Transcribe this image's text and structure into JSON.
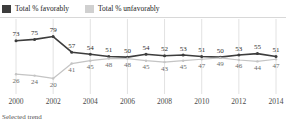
{
  "legend": {
    "items": [
      {
        "label": "Total % favorably",
        "color": "#3d3d3d",
        "icon": "square-swatch-icon"
      },
      {
        "label": "Total % unfavorably",
        "color": "#d0d0d0",
        "icon": "square-swatch-icon"
      }
    ]
  },
  "footer": {
    "note": "Selected trend"
  },
  "chart_data": {
    "type": "line",
    "title": "",
    "subtitle": "",
    "xlabel": "",
    "ylabel": "",
    "grid": "vertical-only",
    "legend_position": "top-left",
    "x": [
      2000,
      2001,
      2002,
      2003,
      2004,
      2005,
      2006,
      2007,
      2008,
      2009,
      2010,
      2011,
      2012,
      2013,
      2014
    ],
    "xtick_labels": [
      "2000",
      "2002",
      "2004",
      "2006",
      "2008",
      "2010",
      "2012",
      "2014"
    ],
    "xtick_values": [
      2000,
      2002,
      2004,
      2006,
      2008,
      2010,
      2012,
      2014
    ],
    "xlim": [
      2000,
      2014
    ],
    "ylim": [
      15,
      84
    ],
    "series": [
      {
        "name": "Total % favorably",
        "color": "#3d3d3d",
        "label_position": "above",
        "values": [
          73,
          75,
          79,
          57,
          54,
          51,
          50,
          54,
          52,
          53,
          51,
          50,
          53,
          55,
          51
        ],
        "labels": [
          "73",
          "75",
          "79",
          "57",
          "54",
          "51",
          "50",
          "54",
          "52",
          "53",
          "51",
          "50",
          "53",
          "55",
          "51"
        ]
      },
      {
        "name": "Total % unfavorably",
        "color": "#c4c4c4",
        "label_position": "below",
        "values": [
          26,
          24,
          20,
          41,
          45,
          48,
          48,
          45,
          43,
          45,
          47,
          49,
          46,
          44,
          47
        ],
        "labels": [
          "26",
          "24",
          "20",
          "41",
          "45",
          "48",
          "48",
          "45",
          "43",
          "45",
          "47",
          "49",
          "46",
          "44",
          "47"
        ]
      }
    ]
  }
}
